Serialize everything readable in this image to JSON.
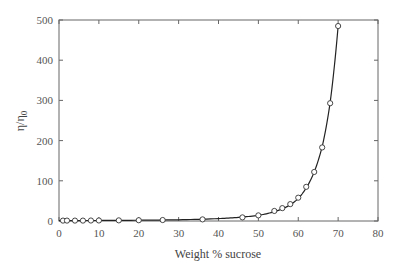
{
  "chart_data": {
    "type": "scatter",
    "title": "",
    "xlabel": "Weight % sucrose",
    "ylabel": "η/η0",
    "ylabel_main": "η/η",
    "ylabel_sub": "0",
    "xlim": [
      0,
      80
    ],
    "ylim": [
      0,
      500
    ],
    "xticks": [
      0,
      10,
      20,
      30,
      40,
      50,
      60,
      70,
      80
    ],
    "yticks": [
      0,
      100,
      200,
      300,
      400,
      500
    ],
    "grid": false,
    "legend": null,
    "series": [
      {
        "name": "measured",
        "style": "open-circle markers",
        "x": [
          1,
          2,
          4,
          6,
          8,
          10,
          15,
          20,
          26,
          36,
          46,
          50,
          54,
          56,
          58,
          60,
          62,
          64,
          66,
          68,
          70
        ],
        "y": [
          1,
          1,
          1,
          1,
          1.2,
          1.3,
          1.6,
          1.9,
          2.4,
          4,
          9,
          14,
          25,
          32,
          42,
          58,
          85,
          122,
          183,
          293,
          485
        ]
      },
      {
        "name": "fit",
        "style": "solid line",
        "x": [
          0,
          10,
          20,
          30,
          40,
          45,
          50,
          54,
          58,
          60,
          62,
          64,
          66,
          68,
          69,
          70
        ],
        "y": [
          1,
          1.3,
          1.9,
          3,
          6,
          9,
          14,
          23,
          40,
          56,
          82,
          122,
          185,
          295,
          380,
          485
        ]
      }
    ]
  }
}
